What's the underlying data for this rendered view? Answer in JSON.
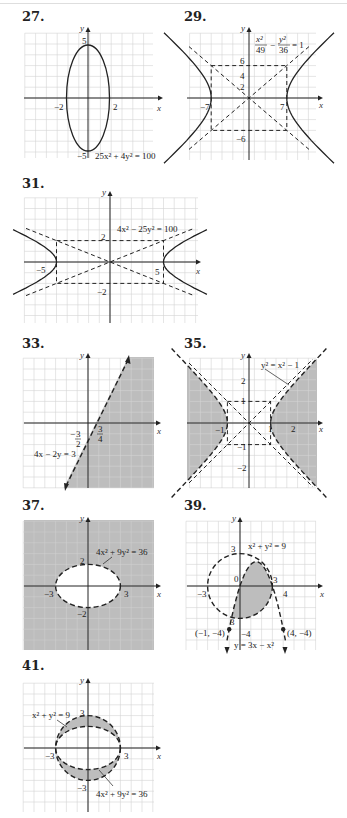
{
  "page": {
    "problems": [
      {
        "number": "27.",
        "equation": "25x² + 4y² = 100"
      },
      {
        "number": "29.",
        "equation_num_x": "x²",
        "equation_den_x": "49",
        "equation_num_y": "y²",
        "equation_den_y": "36",
        "equation_rhs": "= 1"
      },
      {
        "number": "31.",
        "equation": "4x² − 25y² = 100"
      },
      {
        "number": "33.",
        "equation": "4x − 2y = 3"
      },
      {
        "number": "35.",
        "equation": "y² = x² − 1"
      },
      {
        "number": "37.",
        "equation": "4x² + 9y² = 36"
      },
      {
        "number": "39.",
        "equation1": "x² + y² = 9",
        "equation2": "y = 3x − x²",
        "point1": "(−1, −4)",
        "point2": "(4, −4)"
      },
      {
        "number": "41.",
        "equation1": "x² + y² = 9",
        "equation2": "4x² + 9y² = 36"
      }
    ],
    "axis_x": "x",
    "axis_y": "y"
  },
  "chart_data": [
    {
      "id": "27",
      "type": "line",
      "title": "27.",
      "curve": "ellipse",
      "equation": "25x^2 + 4y^2 = 100",
      "semi_axis_x": 2,
      "semi_axis_y": 5,
      "style": "solid",
      "tick_labels": {
        "x": [
          "-2",
          "2"
        ],
        "y": [
          "5",
          "-5"
        ]
      },
      "xlim": [
        -6,
        6
      ],
      "ylim": [
        -6,
        6
      ],
      "grid": true
    },
    {
      "id": "29",
      "type": "line",
      "title": "29.",
      "curve": "hyperbola",
      "equation": "x^2/49 - y^2/36 = 1",
      "vertices": [
        [
          -7,
          0
        ],
        [
          7,
          0
        ]
      ],
      "asymptotes": [
        "y = 6x/7",
        "y = -6x/7"
      ],
      "guide_box": {
        "x": [
          -7,
          7
        ],
        "y": [
          -6,
          6
        ],
        "style": "dashed"
      },
      "tick_labels": {
        "x": [
          "-7",
          "7"
        ],
        "y": [
          "2",
          "4",
          "6",
          "-6"
        ]
      },
      "xlim": [
        -12,
        12
      ],
      "ylim": [
        -10,
        10
      ],
      "grid": true
    },
    {
      "id": "31",
      "type": "line",
      "title": "31.",
      "curve": "hyperbola",
      "equation": "4x^2 - 25y^2 = 100",
      "vertices": [
        [
          -5,
          0
        ],
        [
          5,
          0
        ]
      ],
      "asymptotes": [
        "y = 2x/5",
        "y = -2x/5"
      ],
      "guide_box": {
        "x": [
          -5,
          5
        ],
        "y": [
          -2,
          2
        ],
        "style": "dashed"
      },
      "tick_labels": {
        "x": [
          "-5",
          "5"
        ],
        "y": [
          "2",
          "-2"
        ]
      },
      "xlim": [
        -8,
        8
      ],
      "ylim": [
        -6,
        6
      ],
      "grid": true
    },
    {
      "id": "33",
      "type": "area",
      "title": "33.",
      "boundary": "4x - 2y = 3",
      "boundary_style": "dashed",
      "shaded_region": "4x - 2y > 3 (right/below line)",
      "intercepts": {
        "x": "3/4",
        "y": "-3/2"
      },
      "tick_labels": {
        "x": [
          "3/4"
        ],
        "y": [
          "-3/2"
        ]
      },
      "xlim": [
        -6,
        6
      ],
      "ylim": [
        -6,
        6
      ],
      "grid": true
    },
    {
      "id": "35",
      "type": "area",
      "title": "35.",
      "boundary": "y^2 = x^2 - 1",
      "boundary_style": "dashed",
      "shaded_region": "y^2 < x^2 - 1 (left and right of hyperbola branches)",
      "vertices": [
        [
          -1,
          0
        ],
        [
          1,
          0
        ]
      ],
      "guide_box": {
        "x": [
          -1,
          1
        ],
        "y": [
          -1,
          1
        ],
        "style": "dashed"
      },
      "tick_labels": {
        "x": [
          "-1",
          "1",
          "2"
        ],
        "y": [
          "1",
          "2",
          "-1",
          "-2"
        ]
      },
      "xlim": [
        -3,
        3
      ],
      "ylim": [
        -3,
        3
      ],
      "grid": true
    },
    {
      "id": "37",
      "type": "area",
      "title": "37.",
      "boundary": "4x^2 + 9y^2 = 36",
      "boundary_style": "dashed",
      "shaded_region": "outside ellipse",
      "semi_axis_x": 3,
      "semi_axis_y": 2,
      "tick_labels": {
        "x": [
          "-3",
          "3"
        ],
        "y": [
          "2",
          "-2"
        ]
      },
      "xlim": [
        -6,
        6
      ],
      "ylim": [
        -6,
        6
      ],
      "grid": true
    },
    {
      "id": "39",
      "type": "area",
      "title": "39.",
      "boundaries": [
        "x^2 + y^2 = 9",
        "y = 3x - x^2"
      ],
      "boundary_style": "dashed",
      "shaded_region": "inside circle and below/inside parabola y=3x-x^2 (x≥0 region)",
      "points": [
        {
          "label": "(-1, -4)",
          "x": -1,
          "y": -4
        },
        {
          "label": "(4, -4)",
          "x": 4,
          "y": -4
        }
      ],
      "tick_labels": {
        "x": [
          "-3",
          "0",
          "3",
          "4"
        ],
        "y": [
          "3",
          "-3",
          "-4"
        ]
      },
      "xlim": [
        -5,
        7
      ],
      "ylim": [
        -6,
        6
      ],
      "grid": true
    },
    {
      "id": "41",
      "type": "area",
      "title": "41.",
      "boundaries": [
        "x^2 + y^2 = 9",
        "4x^2 + 9y^2 = 36"
      ],
      "boundary_style": "dashed",
      "shaded_region": "inside circle, outside ellipse",
      "tick_labels": {
        "x": [
          "-3",
          "3"
        ],
        "y": [
          "3",
          "-3"
        ]
      },
      "xlim": [
        -6,
        6
      ],
      "ylim": [
        -6,
        6
      ],
      "grid": true
    }
  ]
}
